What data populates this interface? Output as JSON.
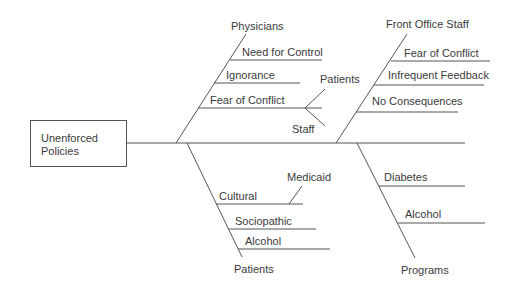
{
  "effect": {
    "line1": "Unenforced",
    "line2": "Policies"
  },
  "categories": {
    "physicians": {
      "label": "Physicians",
      "causes": [
        "Need for Control",
        "Ignorance",
        "Fear of Conflict"
      ],
      "sub_causes": {
        "Fear of Conflict": [
          "Patients",
          "Staff"
        ]
      }
    },
    "front_office_staff": {
      "label": "Front Office Staff",
      "causes": [
        "Fear of Conflict",
        "Infrequent Feedback",
        "No Consequences"
      ]
    },
    "patients": {
      "label": "Patients",
      "causes": [
        "Cultural",
        "Sociopathic",
        "Alcohol"
      ],
      "sub_causes": {
        "Cultural": [
          "Medicaid"
        ]
      }
    },
    "programs": {
      "label": "Programs",
      "causes": [
        "Diabetes",
        "Alcohol"
      ]
    }
  },
  "colors": {
    "line": "#555555",
    "text": "#3a3a3a"
  }
}
